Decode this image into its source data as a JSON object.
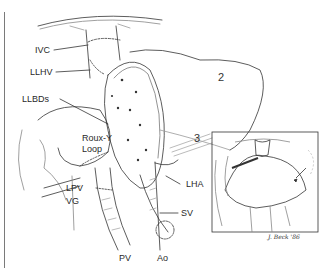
{
  "figure": {
    "type": "surgical illustration",
    "labels": {
      "ivc": "IVC",
      "llhv": "LLHV",
      "llbds": "LLBDs",
      "roux_y_1": "Roux-Y",
      "roux_y_2": "Loop",
      "lpv": "LPV",
      "vg": "VG",
      "pv": "PV",
      "ao": "Ao",
      "sv": "SV",
      "lha": "LHA",
      "segment_2": "2",
      "segment_3": "3"
    },
    "inset": {
      "signature": "J. Beck '86"
    }
  }
}
